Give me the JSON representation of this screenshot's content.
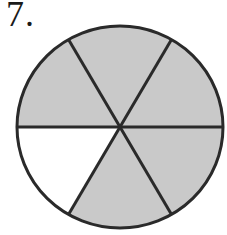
{
  "problem": {
    "number": "7."
  },
  "figure": {
    "type": "circle-fraction",
    "total_parts": 6,
    "shaded_parts": 5,
    "unshaded_parts": 1,
    "shade_color": "#c9c9c9",
    "unshaded_color": "#ffffff",
    "line_color": "#2a2a2a"
  }
}
